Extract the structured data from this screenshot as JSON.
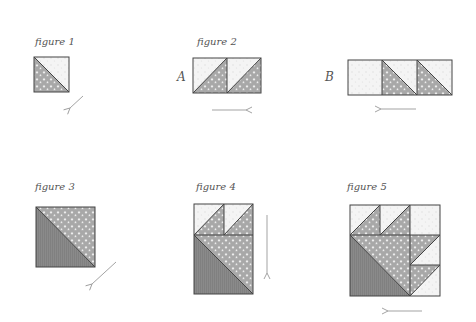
{
  "colors": {
    "light_fabric": "#f4f4f4",
    "light_dot": "#dcdcdc",
    "star_fabric": "#a8a8a8",
    "star_mark": "#f2f2f2",
    "dark_fabric": "#8a8a8a",
    "dark_stripe": "#7e7e7e",
    "outline": "#444444",
    "arrow": "#999999"
  },
  "figures": [
    {
      "id": "figure-1",
      "label": "figure 1",
      "label_pos": [
        35,
        36
      ],
      "pieces": [
        {
          "type": "tri",
          "fabric": "light",
          "points": [
            [
              34,
              57
            ],
            [
              69,
              57
            ],
            [
              69,
              92
            ]
          ]
        },
        {
          "type": "tri",
          "fabric": "star",
          "points": [
            [
              34,
              57
            ],
            [
              34,
              92
            ],
            [
              69,
              92
            ]
          ]
        }
      ],
      "lines": [
        [
          [
            34,
            57
          ],
          [
            69,
            92
          ]
        ]
      ],
      "outline": [
        34,
        57,
        35,
        35
      ],
      "arrow": {
        "from": [
          83,
          96
        ],
        "to": [
          70,
          108
        ]
      }
    },
    {
      "id": "figure-2",
      "label": "figure 2",
      "label_pos": [
        197,
        36
      ],
      "rows": [
        {
          "letter": "A",
          "letter_pos": [
            177,
            70
          ],
          "pieces": [
            {
              "type": "tri",
              "fabric": "light",
              "points": [
                [
                  193,
                  58
                ],
                [
                  227,
                  58
                ],
                [
                  193,
                  93
                ]
              ]
            },
            {
              "type": "tri",
              "fabric": "star",
              "points": [
                [
                  227,
                  58
                ],
                [
                  227,
                  93
                ],
                [
                  193,
                  93
                ]
              ]
            },
            {
              "type": "tri",
              "fabric": "light",
              "points": [
                [
                  227,
                  58
                ],
                [
                  261,
                  58
                ],
                [
                  227,
                  93
                ]
              ]
            },
            {
              "type": "tri",
              "fabric": "star",
              "points": [
                [
                  261,
                  58
                ],
                [
                  261,
                  93
                ],
                [
                  227,
                  93
                ]
              ]
            }
          ],
          "lines": [
            [
              [
                227,
                58
              ],
              [
                193,
                93
              ]
            ],
            [
              [
                261,
                58
              ],
              [
                227,
                93
              ]
            ],
            [
              [
                227,
                58
              ],
              [
                227,
                93
              ]
            ]
          ],
          "outline": [
            193,
            58,
            68,
            35
          ],
          "arrow": {
            "from": [
              212,
              110
            ],
            "to": [
              246,
              110
            ]
          }
        },
        {
          "letter": "B",
          "letter_pos": [
            325,
            70
          ],
          "pieces": [
            {
              "type": "rect",
              "fabric": "light",
              "rect": [
                348,
                60,
                34,
                35
              ]
            },
            {
              "type": "tri",
              "fabric": "light",
              "points": [
                [
                  382,
                  60
                ],
                [
                  417,
                  60
                ],
                [
                  417,
                  95
                ]
              ]
            },
            {
              "type": "tri",
              "fabric": "star",
              "points": [
                [
                  382,
                  60
                ],
                [
                  382,
                  95
                ],
                [
                  417,
                  95
                ]
              ]
            },
            {
              "type": "tri",
              "fabric": "light",
              "points": [
                [
                  417,
                  60
                ],
                [
                  452,
                  60
                ],
                [
                  452,
                  95
                ]
              ]
            },
            {
              "type": "tri",
              "fabric": "star",
              "points": [
                [
                  417,
                  60
                ],
                [
                  417,
                  95
                ],
                [
                  452,
                  95
                ]
              ]
            }
          ],
          "lines": [
            [
              [
                382,
                60
              ],
              [
                417,
                95
              ]
            ],
            [
              [
                417,
                60
              ],
              [
                452,
                95
              ]
            ],
            [
              [
                382,
                60
              ],
              [
                382,
                95
              ]
            ],
            [
              [
                417,
                60
              ],
              [
                417,
                95
              ]
            ]
          ],
          "outline": [
            348,
            60,
            104,
            35
          ],
          "arrow": {
            "from": [
              416,
              109
            ],
            "to": [
              381,
              109
            ]
          }
        }
      ]
    },
    {
      "id": "figure-3",
      "label": "figure 3",
      "label_pos": [
        35,
        181
      ],
      "pieces": [
        {
          "type": "tri",
          "fabric": "star",
          "points": [
            [
              36,
              207
            ],
            [
              95,
              207
            ],
            [
              95,
              267
            ]
          ]
        },
        {
          "type": "tri",
          "fabric": "dark",
          "points": [
            [
              36,
              207
            ],
            [
              36,
              267
            ],
            [
              95,
              267
            ]
          ]
        }
      ],
      "lines": [
        [
          [
            36,
            207
          ],
          [
            95,
            267
          ]
        ]
      ],
      "outline": [
        36,
        207,
        59,
        60
      ],
      "arrow": {
        "from": [
          116,
          262
        ],
        "to": [
          92,
          284
        ]
      }
    },
    {
      "id": "figure-4",
      "label": "figure 4",
      "label_pos": [
        196,
        181
      ],
      "pieces": [
        {
          "type": "tri",
          "fabric": "light",
          "points": [
            [
              194,
              204
            ],
            [
              224,
              204
            ],
            [
              194,
              235
            ]
          ]
        },
        {
          "type": "tri",
          "fabric": "star",
          "points": [
            [
              224,
              204
            ],
            [
              224,
              235
            ],
            [
              194,
              235
            ]
          ]
        },
        {
          "type": "tri",
          "fabric": "light",
          "points": [
            [
              224,
              204
            ],
            [
              253,
              204
            ],
            [
              224,
              235
            ]
          ]
        },
        {
          "type": "tri",
          "fabric": "star",
          "points": [
            [
              253,
              204
            ],
            [
              253,
              235
            ],
            [
              224,
              235
            ]
          ]
        },
        {
          "type": "tri",
          "fabric": "star",
          "points": [
            [
              194,
              235
            ],
            [
              253,
              235
            ],
            [
              253,
              294
            ]
          ]
        },
        {
          "type": "tri",
          "fabric": "dark",
          "points": [
            [
              194,
              235
            ],
            [
              194,
              294
            ],
            [
              253,
              294
            ]
          ]
        }
      ],
      "lines": [
        [
          [
            224,
            204
          ],
          [
            194,
            235
          ]
        ],
        [
          [
            253,
            204
          ],
          [
            224,
            235
          ]
        ],
        [
          [
            224,
            204
          ],
          [
            224,
            235
          ]
        ],
        [
          [
            194,
            235
          ],
          [
            253,
            235
          ]
        ],
        [
          [
            194,
            235
          ],
          [
            253,
            294
          ]
        ]
      ],
      "outline": [
        194,
        204,
        59,
        90
      ],
      "arrow": {
        "from": [
          267,
          215
        ],
        "to": [
          267,
          273
        ]
      }
    },
    {
      "id": "figure-5",
      "label": "figure 5",
      "label_pos": [
        347,
        181
      ],
      "pieces": [
        {
          "type": "tri",
          "fabric": "light",
          "points": [
            [
              350,
              205
            ],
            [
              380,
              205
            ],
            [
              350,
              235
            ]
          ]
        },
        {
          "type": "tri",
          "fabric": "star",
          "points": [
            [
              380,
              205
            ],
            [
              380,
              235
            ],
            [
              350,
              235
            ]
          ]
        },
        {
          "type": "tri",
          "fabric": "light",
          "points": [
            [
              380,
              205
            ],
            [
              410,
              205
            ],
            [
              380,
              235
            ]
          ]
        },
        {
          "type": "tri",
          "fabric": "star",
          "points": [
            [
              410,
              205
            ],
            [
              410,
              235
            ],
            [
              380,
              235
            ]
          ]
        },
        {
          "type": "rect",
          "fabric": "light",
          "rect": [
            410,
            205,
            30,
            30
          ]
        },
        {
          "type": "tri",
          "fabric": "star",
          "points": [
            [
              410,
              235
            ],
            [
              440,
              235
            ],
            [
              410,
              265
            ]
          ]
        },
        {
          "type": "tri",
          "fabric": "light",
          "points": [
            [
              440,
              235
            ],
            [
              440,
              265
            ],
            [
              410,
              265
            ]
          ]
        },
        {
          "type": "tri",
          "fabric": "star",
          "points": [
            [
              410,
              265
            ],
            [
              440,
              265
            ],
            [
              410,
              296
            ]
          ]
        },
        {
          "type": "tri",
          "fabric": "light",
          "points": [
            [
              440,
              265
            ],
            [
              440,
              296
            ],
            [
              410,
              296
            ]
          ]
        },
        {
          "type": "tri",
          "fabric": "star",
          "points": [
            [
              350,
              235
            ],
            [
              410,
              235
            ],
            [
              410,
              296
            ]
          ]
        },
        {
          "type": "tri",
          "fabric": "dark",
          "points": [
            [
              350,
              235
            ],
            [
              350,
              296
            ],
            [
              410,
              296
            ]
          ]
        }
      ],
      "lines": [
        [
          [
            380,
            205
          ],
          [
            350,
            235
          ]
        ],
        [
          [
            410,
            205
          ],
          [
            380,
            235
          ]
        ],
        [
          [
            380,
            205
          ],
          [
            380,
            235
          ]
        ],
        [
          [
            410,
            205
          ],
          [
            410,
            296
          ]
        ],
        [
          [
            350,
            235
          ],
          [
            440,
            235
          ]
        ],
        [
          [
            440,
            235
          ],
          [
            410,
            265
          ]
        ],
        [
          [
            410,
            265
          ],
          [
            440,
            265
          ]
        ],
        [
          [
            440,
            265
          ],
          [
            410,
            296
          ]
        ],
        [
          [
            350,
            235
          ],
          [
            410,
            296
          ]
        ]
      ],
      "outline": [
        350,
        205,
        90,
        91
      ],
      "arrow": {
        "from": [
          422,
          311
        ],
        "to": [
          388,
          311
        ]
      }
    }
  ]
}
